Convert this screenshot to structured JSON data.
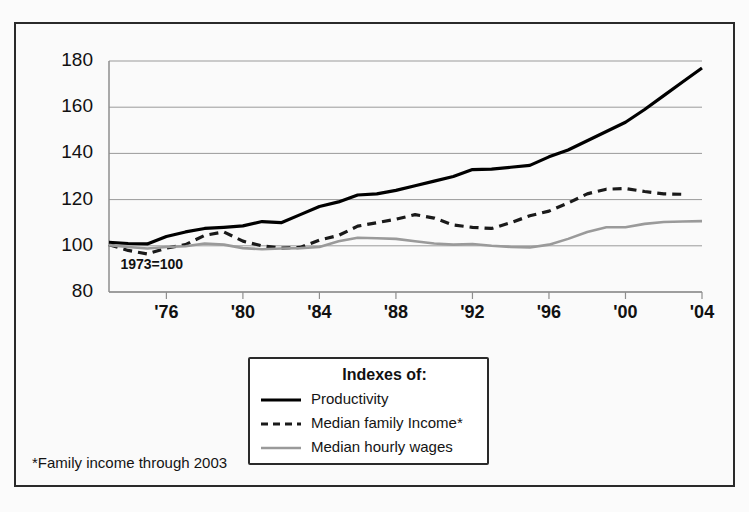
{
  "figure": {
    "base_note": "1973=100",
    "footnote": "*Family income through 2003"
  },
  "legend": {
    "title": "Indexes of:",
    "entries": [
      {
        "label": "Productivity",
        "style": "solid",
        "color": "#000000"
      },
      {
        "label": "Median family Income*",
        "style": "dashed",
        "color": "#1a1a1a"
      },
      {
        "label": "Median hourly wages",
        "style": "solid",
        "color": "#9a9a9a"
      }
    ]
  },
  "chart_data": {
    "type": "line",
    "title": "",
    "subtitle": "",
    "xlabel": "",
    "ylabel": "",
    "xlim": [
      1973,
      2004
    ],
    "ylim": [
      80,
      180
    ],
    "grid": true,
    "legend_position": "below-plot-center",
    "ytick_labels": [
      "80",
      "100",
      "120",
      "140",
      "160",
      "180"
    ],
    "yticks": [
      80,
      100,
      120,
      140,
      160,
      180
    ],
    "xtick_labels": [
      "'76",
      "'80",
      "'84",
      "'88",
      "'92",
      "'96",
      "'00",
      "'04"
    ],
    "xticks": [
      1976,
      1980,
      1984,
      1988,
      1992,
      1996,
      2000,
      2004
    ],
    "annotations": [
      {
        "text": "1973=100",
        "x": 1973.6,
        "y": 90
      }
    ],
    "x": [
      1973,
      1974,
      1975,
      1976,
      1977,
      1978,
      1979,
      1980,
      1981,
      1982,
      1983,
      1984,
      1985,
      1986,
      1987,
      1988,
      1989,
      1990,
      1991,
      1992,
      1993,
      1994,
      1995,
      1996,
      1997,
      1998,
      1999,
      2000,
      2001,
      2002,
      2003,
      2004
    ],
    "series": [
      {
        "name": "Productivity",
        "color": "#000000",
        "style": "solid",
        "values": [
          101.5,
          101.0,
          100.8,
          104.0,
          106.0,
          107.5,
          108.0,
          108.6,
          110.5,
          110.0,
          113.5,
          117.0,
          119.0,
          122.0,
          122.5,
          124.0,
          126.0,
          128.0,
          130.0,
          133.0,
          133.2,
          134.0,
          134.8,
          138.5,
          141.5,
          145.5,
          149.5,
          153.5,
          159.0,
          165.0,
          171.0,
          177.0
        ]
      },
      {
        "name": "Median family Income*",
        "color": "#1a1a1a",
        "style": "dashed",
        "values": [
          100.5,
          98.0,
          96.5,
          99.0,
          100.5,
          104.5,
          106.0,
          102.0,
          100.0,
          99.0,
          99.3,
          102.5,
          104.5,
          108.5,
          110.0,
          111.5,
          113.5,
          112.0,
          109.0,
          108.0,
          107.5,
          110.0,
          113.0,
          115.0,
          118.5,
          122.5,
          124.5,
          124.8,
          123.5,
          122.5,
          122.3,
          null
        ]
      },
      {
        "name": "Median hourly wages",
        "color": "#9a9a9a",
        "style": "solid",
        "values": [
          100.3,
          99.5,
          98.8,
          99.5,
          99.8,
          101.0,
          100.5,
          99.0,
          98.5,
          98.8,
          99.0,
          99.5,
          102.0,
          103.5,
          103.3,
          103.0,
          102.0,
          101.0,
          100.5,
          100.8,
          100.0,
          99.5,
          99.3,
          100.5,
          103.0,
          106.0,
          108.0,
          108.0,
          109.5,
          110.3,
          110.5,
          110.7
        ]
      }
    ]
  }
}
